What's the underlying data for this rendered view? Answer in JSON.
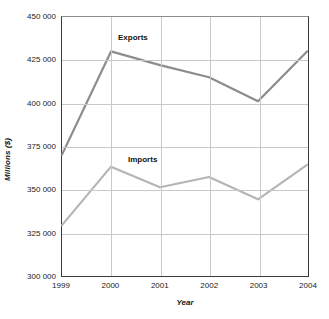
{
  "chart_data": {
    "type": "line",
    "title": "",
    "xlabel": "Year",
    "ylabel": "Millions ($)",
    "categories": [
      "1999",
      "2000",
      "2001",
      "2002",
      "2003",
      "2004"
    ],
    "x": [
      1999,
      2000,
      2001,
      2002,
      2003,
      2004
    ],
    "xlim": [
      1999,
      2004
    ],
    "ylim": [
      300000,
      450000
    ],
    "ytick_step": 25000,
    "ytick_labels": [
      "450 000",
      "425 000",
      "400 000",
      "375 000",
      "350 000",
      "325 000",
      "300 000"
    ],
    "ytick_values": [
      450000,
      425000,
      400000,
      375000,
      350000,
      325000,
      300000
    ],
    "grid": true,
    "legend_position": "inline-annotations",
    "series": [
      {
        "name": "Exports",
        "color": "#8c8c8c",
        "values": [
          370000,
          430000,
          422000,
          415000,
          401000,
          430000
        ]
      },
      {
        "name": "Imports",
        "color": "#b5b5b5",
        "values": [
          329000,
          363000,
          351000,
          357000,
          344000,
          364000
        ]
      }
    ],
    "annotations": [
      {
        "text": "Exports",
        "series": "Exports"
      },
      {
        "text": "Imports",
        "series": "Imports"
      }
    ]
  }
}
